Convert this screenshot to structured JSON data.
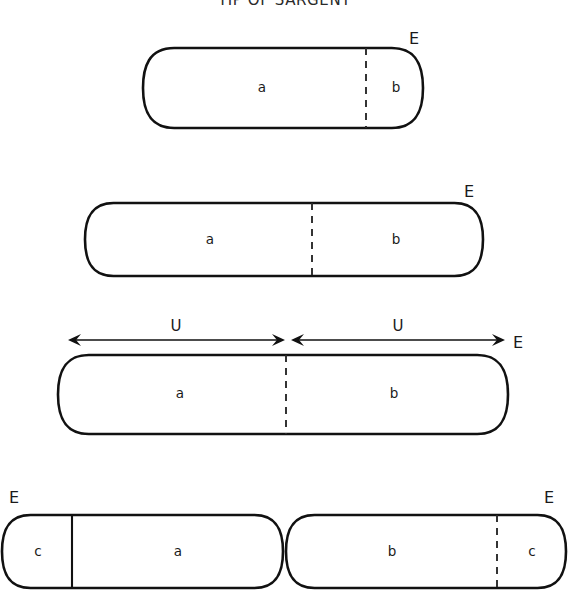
{
  "figure": {
    "title": "TIP OF SARGENT",
    "title_clipped": true,
    "background_color": "#ffffff",
    "line_color": "#111111"
  },
  "rows": [
    {
      "id": "row-1",
      "shapes": [
        {
          "id": "row1-pill",
          "x": 143,
          "y": 48,
          "width": 280,
          "height": 80,
          "divider": {
            "x": 366,
            "style": "dashed"
          },
          "segments": [
            {
              "label": "a",
              "cx": 262,
              "cy": 88
            },
            {
              "label": "b",
              "cx": 396,
              "cy": 88
            }
          ],
          "end_labels": [
            {
              "label": "E",
              "x": 414,
              "y": 39
            }
          ]
        }
      ]
    },
    {
      "id": "row-2",
      "shapes": [
        {
          "id": "row2-pill",
          "x": 85,
          "y": 203,
          "width": 398,
          "height": 73,
          "divider": {
            "x": 312,
            "style": "dashed"
          },
          "segments": [
            {
              "label": "a",
              "cx": 210,
              "cy": 240
            },
            {
              "label": "b",
              "cx": 396,
              "cy": 240
            }
          ],
          "end_labels": [
            {
              "label": "E",
              "x": 469,
              "y": 192
            }
          ]
        }
      ]
    },
    {
      "id": "row-3",
      "dimensions": [
        {
          "label": "U",
          "x1": 68,
          "x2": 285,
          "y": 340,
          "label_x": 176,
          "label_y": 326
        },
        {
          "label": "U",
          "x1": 291,
          "x2": 505,
          "y": 340,
          "label_x": 398,
          "label_y": 326
        }
      ],
      "shapes": [
        {
          "id": "row3-pill",
          "x": 58,
          "y": 355,
          "width": 450,
          "height": 79,
          "divider": {
            "x": 286,
            "style": "dashed"
          },
          "segments": [
            {
              "label": "a",
              "cx": 180,
              "cy": 394
            },
            {
              "label": "b",
              "cx": 394,
              "cy": 394
            }
          ],
          "end_labels": [
            {
              "label": "E",
              "x": 518,
              "y": 343
            }
          ]
        }
      ]
    },
    {
      "id": "row-4",
      "shapes": [
        {
          "id": "row4-pill-left",
          "x": 2,
          "y": 515,
          "width": 281,
          "height": 73,
          "divider": {
            "x": 72,
            "style": "solid"
          },
          "segments": [
            {
              "label": "c",
              "cx": 38,
              "cy": 552
            },
            {
              "label": "a",
              "cx": 178,
              "cy": 552
            }
          ],
          "end_labels": [
            {
              "label": "E",
              "x": 14,
              "y": 498
            }
          ]
        },
        {
          "id": "row4-pill-right",
          "x": 286,
          "y": 515,
          "width": 280,
          "height": 73,
          "divider": {
            "x": 497,
            "style": "dashed"
          },
          "segments": [
            {
              "label": "b",
              "cx": 392,
              "cy": 552
            },
            {
              "label": "c",
              "cx": 532,
              "cy": 552
            }
          ],
          "end_labels": [
            {
              "label": "E",
              "x": 549,
              "y": 498
            }
          ]
        }
      ]
    }
  ]
}
